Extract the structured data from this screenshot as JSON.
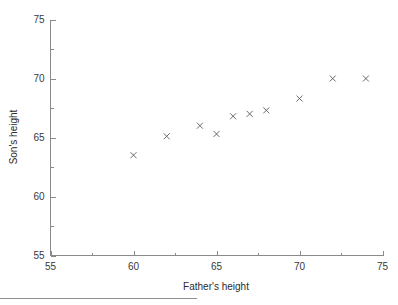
{
  "chart_data": {
    "type": "scatter",
    "title": "",
    "xlabel": "Father's height",
    "ylabel": "Son's height",
    "xlim": [
      55,
      75
    ],
    "ylim": [
      55,
      75
    ],
    "xticks": [
      55,
      60,
      65,
      70,
      75
    ],
    "xticklabels": [
      "55",
      "60",
      "65",
      "70",
      "75"
    ],
    "yticks": [
      55,
      60,
      65,
      70,
      75
    ],
    "yticklabels": [
      "55",
      "60",
      "65",
      "70",
      "75"
    ],
    "xminorticks": [
      57.5,
      62.5,
      67.5,
      72.5
    ],
    "yminorticks": [
      57.5,
      62.5,
      67.5,
      72.5
    ],
    "grid": false,
    "legend": false,
    "marker": "x",
    "marker_color": "#555a60",
    "series": [
      {
        "name": "father-son heights",
        "x": [
          60,
          62,
          64,
          65,
          66,
          67,
          68,
          70,
          72,
          74
        ],
        "y": [
          63.5,
          65.1,
          66.0,
          65.3,
          66.8,
          67.0,
          67.3,
          68.3,
          70.0,
          70.0
        ]
      }
    ]
  },
  "axes": {
    "x_title": "Father's height",
    "y_title": "Son's height"
  },
  "ticks": {
    "x_labels": [
      "55",
      "60",
      "65",
      "70",
      "75"
    ],
    "y_labels": [
      "55",
      "60",
      "65",
      "70",
      "75"
    ]
  }
}
